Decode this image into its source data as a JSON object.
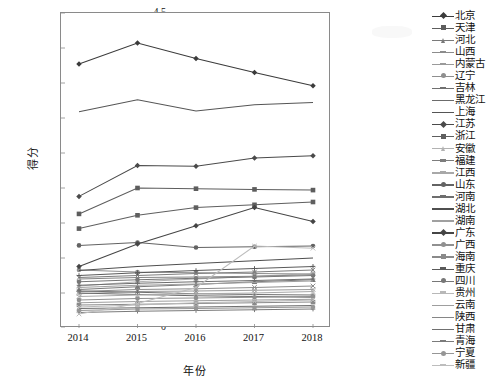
{
  "chart": {
    "type": "line",
    "xlabel": "年份",
    "ylabel": "得分",
    "ylim": [
      0,
      4.5
    ],
    "ytick_step": 0.5,
    "grid": false,
    "legend_position": "right"
  },
  "axes": {
    "yticks": [
      "4.5",
      "4",
      "3.5",
      "3",
      "2.5",
      "2",
      "1.5",
      "1",
      "0.5",
      "0"
    ],
    "xticks": [
      "2014",
      "2015",
      "2016",
      "2017",
      "2018"
    ]
  },
  "chart_data": {
    "type": "line",
    "title": "",
    "xlabel": "年份",
    "ylabel": "得分",
    "ylim": [
      0,
      4.5
    ],
    "grid": false,
    "legend_position": "right",
    "x": [
      "2014",
      "2015",
      "2016",
      "2017",
      "2018"
    ],
    "series": [
      {
        "name": "北京",
        "marker": "diamond",
        "color": "#3b3b3b",
        "values": [
          3.77,
          4.07,
          3.85,
          3.65,
          3.46
        ]
      },
      {
        "name": "天津",
        "marker": "square",
        "color": "#5d5d5d",
        "values": [
          1.63,
          2.0,
          1.99,
          1.98,
          1.97
        ]
      },
      {
        "name": "河北",
        "marker": "triangle",
        "color": "#7a7a7a",
        "values": [
          0.55,
          0.59,
          0.62,
          0.66,
          0.69
        ]
      },
      {
        "name": "山西",
        "marker": "x",
        "color": "#8c8c8c",
        "values": [
          0.52,
          0.55,
          0.56,
          0.58,
          0.6
        ]
      },
      {
        "name": "内蒙古",
        "marker": "x",
        "color": "#9a9a9a",
        "values": [
          0.49,
          0.52,
          0.53,
          0.54,
          0.55
        ]
      },
      {
        "name": "辽宁",
        "marker": "circle",
        "color": "#8f8f8f",
        "values": [
          0.83,
          0.8,
          0.79,
          0.78,
          0.77
        ]
      },
      {
        "name": "吉林",
        "marker": "plus",
        "color": "#707070",
        "values": [
          0.53,
          0.51,
          0.49,
          0.48,
          0.47
        ]
      },
      {
        "name": "黑龙江",
        "marker": "none",
        "color": "#6b6b6b",
        "values": [
          0.5,
          0.48,
          0.46,
          0.45,
          0.44
        ]
      },
      {
        "name": "上海",
        "marker": "none",
        "color": "#555555",
        "values": [
          3.09,
          3.26,
          3.1,
          3.19,
          3.22
        ]
      },
      {
        "name": "江苏",
        "marker": "diamond",
        "color": "#4a4a4a",
        "values": [
          1.88,
          2.32,
          2.31,
          2.43,
          2.46
        ]
      },
      {
        "name": "浙江",
        "marker": "square",
        "color": "#5f5f5f",
        "values": [
          1.42,
          1.61,
          1.72,
          1.76,
          1.8
        ]
      },
      {
        "name": "安徽",
        "marker": "triangle",
        "color": "#b2b2b2",
        "values": [
          0.6,
          0.66,
          0.7,
          0.74,
          0.78
        ]
      },
      {
        "name": "福建",
        "marker": "x",
        "color": "#7d7d7d",
        "values": [
          0.72,
          0.75,
          0.78,
          0.8,
          0.83
        ]
      },
      {
        "name": "江西",
        "marker": "x",
        "color": "#a8a8a8",
        "values": [
          0.45,
          0.47,
          0.49,
          0.5,
          0.52
        ]
      },
      {
        "name": "山东",
        "marker": "circle",
        "color": "#636363",
        "values": [
          1.18,
          1.22,
          1.15,
          1.16,
          1.17
        ]
      },
      {
        "name": "河南",
        "marker": "plus",
        "color": "#6e6e6e",
        "values": [
          0.61,
          0.64,
          0.66,
          0.68,
          0.7
        ]
      },
      {
        "name": "湖北",
        "marker": "none",
        "color": "#4f4f4f",
        "values": [
          0.82,
          0.88,
          0.92,
          0.96,
          1.0
        ]
      },
      {
        "name": "湖南",
        "marker": "none",
        "color": "#a0a0a0",
        "values": [
          0.58,
          0.61,
          0.63,
          0.65,
          0.67
        ]
      },
      {
        "name": "广东",
        "marker": "diamond",
        "color": "#454545",
        "values": [
          0.88,
          1.2,
          1.46,
          1.72,
          1.52
        ]
      },
      {
        "name": "广西",
        "marker": "circle",
        "color": "#909090",
        "values": [
          0.4,
          0.42,
          0.43,
          0.44,
          0.45
        ]
      },
      {
        "name": "海南",
        "marker": "square",
        "color": "#8a8a8a",
        "values": [
          0.33,
          0.34,
          0.35,
          0.36,
          0.37
        ]
      },
      {
        "name": "重庆",
        "marker": "plus",
        "color": "#5a5a5a",
        "values": [
          0.75,
          0.79,
          0.82,
          0.85,
          0.88
        ]
      },
      {
        "name": "四川",
        "marker": "circle",
        "color": "#777777",
        "values": [
          0.66,
          0.69,
          0.71,
          0.73,
          0.75
        ]
      },
      {
        "name": "贵州",
        "marker": "x",
        "color": "#b8b8b8",
        "values": [
          0.3,
          0.33,
          0.36,
          0.38,
          0.4
        ]
      },
      {
        "name": "云南",
        "marker": "none",
        "color": "#9e9e9e",
        "values": [
          0.36,
          0.38,
          0.39,
          0.4,
          0.41
        ]
      },
      {
        "name": "陕西",
        "marker": "none",
        "color": "#868686",
        "values": [
          0.7,
          0.72,
          0.73,
          0.74,
          0.76
        ]
      },
      {
        "name": "甘肃",
        "marker": "none",
        "color": "#707070",
        "values": [
          0.28,
          0.29,
          0.3,
          0.31,
          0.32
        ]
      },
      {
        "name": "青海",
        "marker": "plus",
        "color": "#7b7b7b",
        "values": [
          0.22,
          0.24,
          0.25,
          0.26,
          0.27
        ]
      },
      {
        "name": "宁夏",
        "marker": "circle",
        "color": "#969696",
        "values": [
          0.25,
          0.27,
          0.28,
          0.29,
          0.3
        ]
      },
      {
        "name": "新疆",
        "marker": "x",
        "color": "#bdbdbd",
        "values": [
          0.2,
          0.35,
          0.58,
          1.17,
          1.14
        ]
      }
    ]
  }
}
